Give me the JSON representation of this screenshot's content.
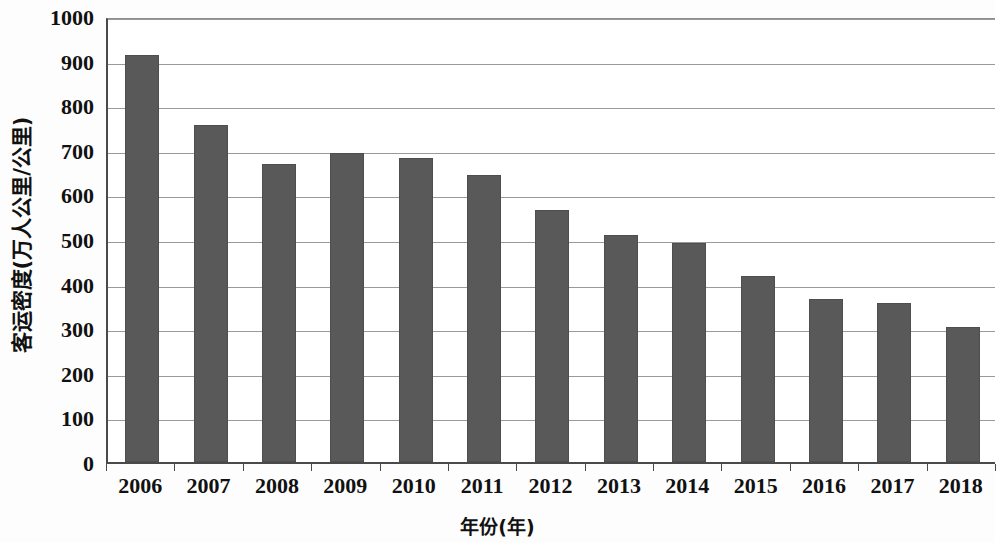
{
  "chart_data": {
    "type": "bar",
    "title": "",
    "xlabel": "年份(年)",
    "ylabel": "客运密度(万人公里/公里)",
    "categories": [
      "2006",
      "2007",
      "2008",
      "2009",
      "2010",
      "2011",
      "2012",
      "2013",
      "2014",
      "2015",
      "2016",
      "2017",
      "2018"
    ],
    "values": [
      912,
      755,
      668,
      692,
      682,
      643,
      566,
      510,
      490,
      416,
      365,
      357,
      303
    ],
    "series": [
      {
        "name": "客运密度",
        "values": [
          912,
          755,
          668,
          692,
          682,
          643,
          566,
          510,
          490,
          416,
          365,
          357,
          303
        ]
      }
    ],
    "ylim": [
      0,
      1000
    ],
    "y_ticks": [
      0,
      100,
      200,
      300,
      400,
      500,
      600,
      700,
      800,
      900,
      1000
    ],
    "y_tick_labels": [
      "0",
      "100",
      "200",
      "300",
      "400",
      "500",
      "600",
      "700",
      "800",
      "900",
      "1000"
    ],
    "grid": true,
    "grid_axis": "y",
    "legend": false,
    "legend_position": "none",
    "bar_color": "#595959",
    "axis_color": "#4a4a4a",
    "grid_color": "#9a9a9a",
    "background_color": "#ffffff"
  }
}
